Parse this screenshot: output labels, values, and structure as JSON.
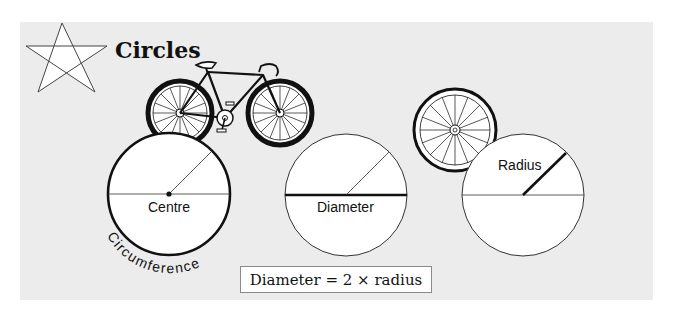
{
  "header": {
    "title": "Circles",
    "icon": "star-icon"
  },
  "diagrams": [
    {
      "id": "centre",
      "label": "Centre",
      "arc_label": "Circumference",
      "highlight": "circumference"
    },
    {
      "id": "diameter",
      "label": "Diameter",
      "highlight": "diameter"
    },
    {
      "id": "radius",
      "label": "Radius",
      "highlight": "radius"
    }
  ],
  "illustrations": [
    "bicycle-icon",
    "wheel-icon"
  ],
  "formula": {
    "text": "Diameter = 2 × radius"
  },
  "colors": {
    "panel": "#ececec",
    "stroke": "#111111",
    "circle_fill": "#ffffff"
  }
}
